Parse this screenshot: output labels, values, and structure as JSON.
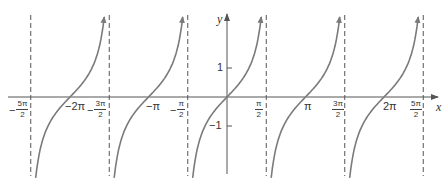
{
  "chart_data": {
    "type": "line",
    "title": "",
    "function": "y = tan x",
    "xlabel": "x",
    "ylabel": "y",
    "xlim": [
      "-5π/2",
      "5π/2"
    ],
    "ylim": [
      -2.8,
      2.8
    ],
    "grid": false,
    "legend": null,
    "x_ticks": [
      {
        "label_sign": "−",
        "label_num": "5π",
        "label_den": "2",
        "value": -7.854,
        "type": "fraction"
      },
      {
        "label": "−2π",
        "value": -6.283,
        "type": "plain"
      },
      {
        "label_sign": "−",
        "label_num": "3π",
        "label_den": "2",
        "value": -4.712,
        "type": "fraction"
      },
      {
        "label": "−π",
        "value": -3.142,
        "type": "plain"
      },
      {
        "label_sign": "−",
        "label_num": "π",
        "label_den": "2",
        "value": -1.571,
        "type": "fraction"
      },
      {
        "label_sign": "",
        "label_num": "π",
        "label_den": "2",
        "value": 1.571,
        "type": "fraction"
      },
      {
        "label": "π",
        "value": 3.142,
        "type": "plain"
      },
      {
        "label_sign": "",
        "label_num": "3π",
        "label_den": "2",
        "value": 4.712,
        "type": "fraction"
      },
      {
        "label": "2π",
        "value": 6.283,
        "type": "plain"
      },
      {
        "label_sign": "",
        "label_num": "5π",
        "label_den": "2",
        "value": 7.854,
        "type": "fraction"
      }
    ],
    "y_ticks": [
      {
        "label": "1",
        "value": 1
      },
      {
        "label": "−1",
        "value": -1
      }
    ],
    "asymptotes": [
      "-5π/2",
      "-3π/2",
      "-π/2",
      "π/2",
      "3π/2",
      "5π/2"
    ],
    "branches_centered_at": [
      "-2π",
      "-π",
      "0",
      "π",
      "2π"
    ],
    "colors": {
      "curve": "#7a7a7a",
      "axis": "#555555",
      "asymptote": "#555555",
      "text": "#333333"
    }
  },
  "labels": {
    "x_axis": "x",
    "y_axis": "y",
    "y_tick_pos": "1",
    "y_tick_neg": "−1",
    "neg_2pi": "−2π",
    "neg_pi": "−π",
    "pi": "π",
    "two_pi": "2π",
    "neg_5pi_2": {
      "sign": "−",
      "num": "5π",
      "den": "2"
    },
    "neg_3pi_2": {
      "sign": "−",
      "num": "3π",
      "den": "2"
    },
    "neg_pi_2": {
      "sign": "−",
      "num": "π",
      "den": "2"
    },
    "pi_2": {
      "num": "π",
      "den": "2"
    },
    "three_pi_2": {
      "num": "3π",
      "den": "2"
    },
    "five_pi_2": {
      "num": "5π",
      "den": "2"
    }
  }
}
